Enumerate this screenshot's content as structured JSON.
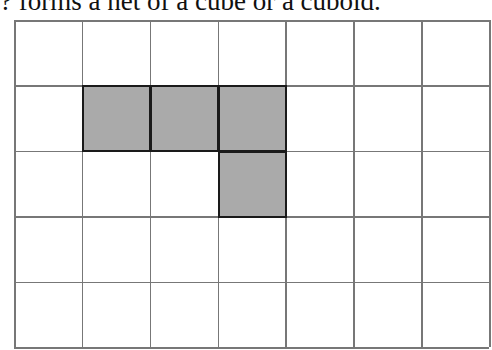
{
  "caption": "? forms a net of a cube or a cuboid.",
  "grid": {
    "columns": 7,
    "rows": 5,
    "line_color": "#777777",
    "fill_color": "#aaaaaa",
    "shaded_cells": [
      {
        "row": 1,
        "col": 1
      },
      {
        "row": 1,
        "col": 2
      },
      {
        "row": 1,
        "col": 3
      },
      {
        "row": 2,
        "col": 3
      }
    ]
  }
}
